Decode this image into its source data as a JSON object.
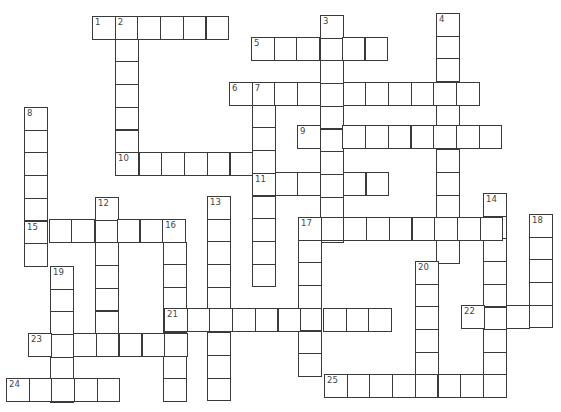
{
  "puzzle": {
    "cell_size": 22.7,
    "words": [
      {
        "number": "1",
        "direction": "across",
        "x": 92,
        "y": 16,
        "length": 6
      },
      {
        "number": "2",
        "direction": "down",
        "x": 115,
        "y": 16,
        "length": 7
      },
      {
        "number": "3",
        "direction": "down",
        "x": 320,
        "y": 15,
        "length": 10
      },
      {
        "number": "4",
        "direction": "down",
        "x": 436,
        "y": 13,
        "length": 11
      },
      {
        "number": "5",
        "direction": "across",
        "x": 251,
        "y": 37,
        "length": 6
      },
      {
        "number": "6",
        "direction": "across",
        "x": 229,
        "y": 82,
        "length": 11
      },
      {
        "number": "7",
        "direction": "down",
        "x": 252,
        "y": 82,
        "length": 9
      },
      {
        "number": "8",
        "direction": "down",
        "x": 24,
        "y": 107,
        "length": 7
      },
      {
        "number": "9",
        "direction": "across",
        "x": 297,
        "y": 125,
        "length": 9
      },
      {
        "number": "10",
        "direction": "across",
        "x": 116,
        "y": 152,
        "length": 7
      },
      {
        "number": "11",
        "direction": "across",
        "x": 252,
        "y": 172,
        "length": 6
      },
      {
        "number": "12",
        "direction": "down",
        "x": 95,
        "y": 197,
        "length": 7
      },
      {
        "number": "13",
        "direction": "down",
        "x": 207,
        "y": 196,
        "length": 9
      },
      {
        "number": "14",
        "direction": "down",
        "x": 483,
        "y": 193,
        "length": 9
      },
      {
        "number": "15",
        "direction": "across",
        "x": 26,
        "y": 219,
        "length": 7
      },
      {
        "number": "16",
        "direction": "down",
        "x": 163,
        "y": 219,
        "length": 8
      },
      {
        "number": "17",
        "direction": "across",
        "x": 298,
        "y": 217,
        "length": 9
      },
      {
        "number": "",
        "direction": "down",
        "x": 298,
        "y": 217,
        "length": 7
      },
      {
        "number": "18",
        "direction": "down",
        "x": 529,
        "y": 214,
        "length": 5
      },
      {
        "number": "19",
        "direction": "down",
        "x": 50,
        "y": 266,
        "length": 6
      },
      {
        "number": "20",
        "direction": "down",
        "x": 415,
        "y": 261,
        "length": 5
      },
      {
        "number": "21",
        "direction": "across",
        "x": 164,
        "y": 308,
        "length": 10
      },
      {
        "number": "22",
        "direction": "across",
        "x": 461,
        "y": 305,
        "length": 4
      },
      {
        "number": "23",
        "direction": "across",
        "x": 28,
        "y": 333,
        "length": 7
      },
      {
        "number": "24",
        "direction": "across",
        "x": 6,
        "y": 378,
        "length": 5
      },
      {
        "number": "25",
        "direction": "across",
        "x": 324,
        "y": 374,
        "length": 8
      }
    ]
  },
  "colors": {
    "grid_line": "#3a3a3a",
    "cell_fill": "#ffffff",
    "number_text": "#444444"
  }
}
